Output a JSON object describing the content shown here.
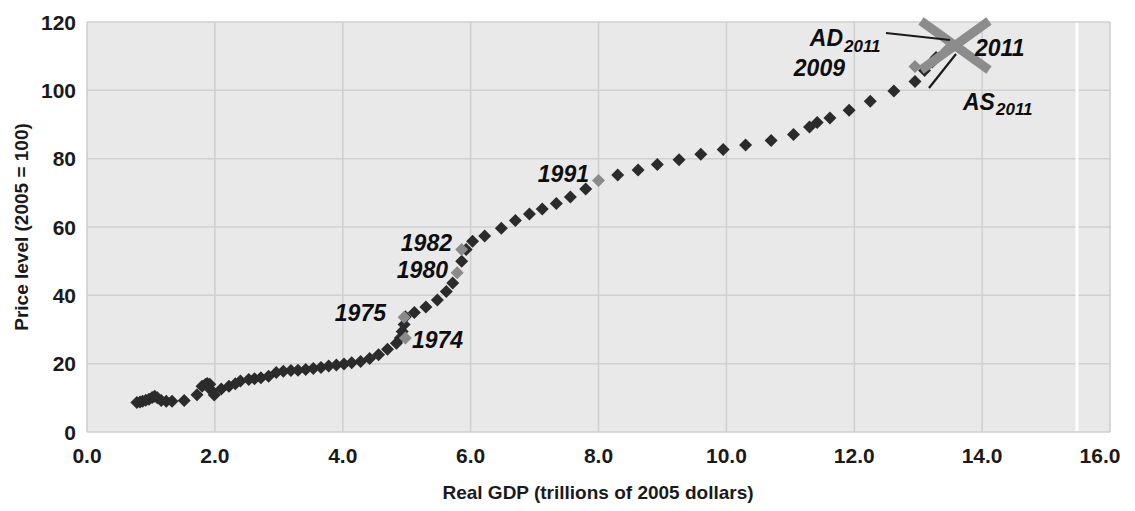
{
  "chart_data": {
    "type": "scatter",
    "title": "",
    "xlabel": "Real GDP (trillions of 2005 dollars)",
    "ylabel": "Price level (2005 = 100)",
    "xlim": [
      0.0,
      16.0
    ],
    "ylim": [
      0,
      120
    ],
    "xticks": [
      "0.0",
      "2.0",
      "4.0",
      "6.0",
      "8.0",
      "10.0",
      "12.0",
      "14.0",
      "16.0"
    ],
    "yticks": [
      "0",
      "20",
      "40",
      "60",
      "80",
      "100",
      "120"
    ],
    "grid": true,
    "legend": "none",
    "series": [
      {
        "name": "US economy (real GDP vs price level)",
        "points": [
          {
            "x": 0.78,
            "y": 8.6
          },
          {
            "x": 0.83,
            "y": 8.8
          },
          {
            "x": 0.87,
            "y": 9.0
          },
          {
            "x": 0.92,
            "y": 9.3
          },
          {
            "x": 0.97,
            "y": 9.6
          },
          {
            "x": 1.02,
            "y": 10.1
          },
          {
            "x": 1.06,
            "y": 10.5
          },
          {
            "x": 1.1,
            "y": 10.0
          },
          {
            "x": 1.16,
            "y": 9.2
          },
          {
            "x": 1.24,
            "y": 9.0
          },
          {
            "x": 1.33,
            "y": 9.0
          },
          {
            "x": 1.52,
            "y": 9.2
          },
          {
            "x": 1.72,
            "y": 10.9
          },
          {
            "x": 1.8,
            "y": 13.4
          },
          {
            "x": 1.85,
            "y": 13.9
          },
          {
            "x": 1.88,
            "y": 14.2
          },
          {
            "x": 1.92,
            "y": 14.0
          },
          {
            "x": 1.95,
            "y": 12.1
          },
          {
            "x": 1.99,
            "y": 10.8
          },
          {
            "x": 2.1,
            "y": 12.6
          },
          {
            "x": 2.22,
            "y": 13.4
          },
          {
            "x": 2.32,
            "y": 14.1
          },
          {
            "x": 2.4,
            "y": 14.9
          },
          {
            "x": 2.53,
            "y": 15.4
          },
          {
            "x": 2.62,
            "y": 15.6
          },
          {
            "x": 2.72,
            "y": 15.9
          },
          {
            "x": 2.84,
            "y": 16.3
          },
          {
            "x": 2.96,
            "y": 17.4
          },
          {
            "x": 3.07,
            "y": 17.8
          },
          {
            "x": 3.19,
            "y": 18.0
          },
          {
            "x": 3.3,
            "y": 18.1
          },
          {
            "x": 3.42,
            "y": 18.3
          },
          {
            "x": 3.54,
            "y": 18.6
          },
          {
            "x": 3.66,
            "y": 18.9
          },
          {
            "x": 3.78,
            "y": 19.3
          },
          {
            "x": 3.9,
            "y": 19.6
          },
          {
            "x": 4.02,
            "y": 19.9
          },
          {
            "x": 4.14,
            "y": 20.3
          },
          {
            "x": 4.28,
            "y": 20.6
          },
          {
            "x": 4.42,
            "y": 21.5
          },
          {
            "x": 4.56,
            "y": 22.6
          },
          {
            "x": 4.7,
            "y": 24.2
          },
          {
            "x": 4.84,
            "y": 26.0
          },
          {
            "x": 4.9,
            "y": 27.5
          },
          {
            "x": 4.93,
            "y": 29.4
          },
          {
            "x": 4.96,
            "y": 31.5
          },
          {
            "x": 4.98,
            "y": 33.7
          },
          {
            "x": 5.12,
            "y": 35.0
          },
          {
            "x": 5.3,
            "y": 36.6
          },
          {
            "x": 5.48,
            "y": 38.6
          },
          {
            "x": 5.62,
            "y": 41.1
          },
          {
            "x": 5.72,
            "y": 43.6
          },
          {
            "x": 5.79,
            "y": 46.6
          },
          {
            "x": 5.86,
            "y": 50.0
          },
          {
            "x": 5.93,
            "y": 53.4
          },
          {
            "x": 6.03,
            "y": 55.8
          },
          {
            "x": 6.22,
            "y": 57.4
          },
          {
            "x": 6.48,
            "y": 59.6
          },
          {
            "x": 6.7,
            "y": 61.9
          },
          {
            "x": 6.92,
            "y": 63.8
          },
          {
            "x": 7.12,
            "y": 65.3
          },
          {
            "x": 7.34,
            "y": 66.9
          },
          {
            "x": 7.56,
            "y": 68.8
          },
          {
            "x": 7.8,
            "y": 71.1
          },
          {
            "x": 8.0,
            "y": 73.6
          },
          {
            "x": 8.3,
            "y": 75.2
          },
          {
            "x": 8.62,
            "y": 76.7
          },
          {
            "x": 8.92,
            "y": 78.3
          },
          {
            "x": 9.26,
            "y": 79.7
          },
          {
            "x": 9.6,
            "y": 81.3
          },
          {
            "x": 9.95,
            "y": 82.7
          },
          {
            "x": 10.3,
            "y": 84.0
          },
          {
            "x": 10.7,
            "y": 85.3
          },
          {
            "x": 11.05,
            "y": 87.1
          },
          {
            "x": 11.3,
            "y": 89.3
          },
          {
            "x": 11.42,
            "y": 90.6
          },
          {
            "x": 11.62,
            "y": 91.9
          },
          {
            "x": 11.92,
            "y": 94.2
          },
          {
            "x": 12.25,
            "y": 96.8
          },
          {
            "x": 12.62,
            "y": 99.8
          },
          {
            "x": 12.95,
            "y": 102.6
          },
          {
            "x": 13.1,
            "y": 105.8
          },
          {
            "x": 13.22,
            "y": 108.3
          },
          {
            "x": 13.28,
            "y": 109.6
          }
        ]
      }
    ],
    "highlighted_points": [
      {
        "label": "1974",
        "x": 4.98,
        "y": 27.5
      },
      {
        "label": "1975",
        "x": 4.96,
        "y": 33.6
      },
      {
        "label": "1980",
        "x": 5.79,
        "y": 46.6
      },
      {
        "label": "1982",
        "x": 5.86,
        "y": 53.4
      },
      {
        "label": "1991",
        "x": 8.0,
        "y": 73.6
      },
      {
        "label": "2009",
        "x": 12.95,
        "y": 107.0
      },
      {
        "label": "2011",
        "x": 13.45,
        "y": 111.8
      }
    ],
    "annotations": [
      {
        "text": "1974",
        "x": 4.98,
        "y": 27.5
      },
      {
        "text": "1975",
        "x": 4.96,
        "y": 33.6
      },
      {
        "text": "1980",
        "x": 5.79,
        "y": 46.6
      },
      {
        "text": "1982",
        "x": 5.86,
        "y": 53.4
      },
      {
        "text": "1991",
        "x": 8.0,
        "y": 73.6
      },
      {
        "text": "2009",
        "x": 12.95,
        "y": 107.0
      },
      {
        "text": "2011",
        "x": 13.45,
        "y": 111.8
      },
      {
        "text": "AD_2011",
        "x": 13.45,
        "y": 111.8
      },
      {
        "text": "AS_2011",
        "x": 13.45,
        "y": 111.8
      }
    ],
    "curves": [
      {
        "name": "AD2011",
        "slope": "downward",
        "color": "#8c8c8c"
      },
      {
        "name": "AS2011",
        "slope": "upward",
        "color": "#8c8c8c"
      }
    ]
  },
  "labels": {
    "y_axis_title": "Price level (2005 = 100)",
    "x_axis_title": "Real GDP (trillions of 2005 dollars)",
    "yticks": [
      "120",
      "100",
      "80",
      "60",
      "40",
      "20",
      "0"
    ],
    "xticks": [
      "0.0",
      "2.0",
      "4.0",
      "6.0",
      "8.0",
      "10.0",
      "12.0",
      "14.0",
      "16.0"
    ],
    "ad_main": "AD",
    "ad_sub": "2011",
    "as_main": "AS",
    "as_sub": "2011",
    "year_2011": "2011",
    "year_2009": "2009",
    "year_1991": "1991",
    "year_1982": "1982",
    "year_1980": "1980",
    "year_1975": "1975",
    "year_1974": "1974"
  },
  "colors": {
    "plot_background": "#e9e9e9",
    "page_background": "#ffffff",
    "datapoint": "#2b2b2b",
    "datapoint_highlight": "#8a8a8a",
    "curve": "#8c8c8c",
    "gridline": "#d0d0d0",
    "text": "#1a1a1a"
  }
}
